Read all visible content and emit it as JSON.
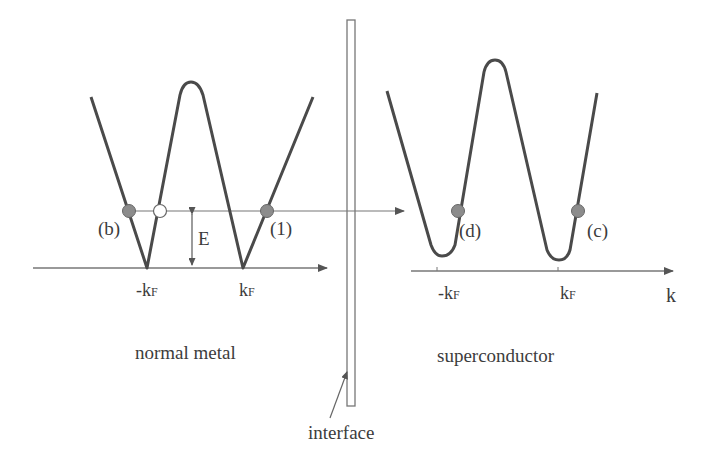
{
  "diagram": {
    "title": "",
    "regions": {
      "left": "normal metal",
      "right": "superconductor",
      "interface": "interface"
    },
    "energy_label": "E",
    "axis_label_k": "k",
    "left_ticks": {
      "neg": "-k",
      "pos": "k",
      "sub": "F"
    },
    "right_ticks": {
      "neg": "-k",
      "pos": "k",
      "sub": "F"
    },
    "points": {
      "b": "(b)",
      "one": "(1)",
      "d": "(d)",
      "c": "(c)"
    },
    "colors": {
      "line": "#4a4a4a",
      "filled_dot": "#8c8c8c",
      "open_dot": "#ffffff",
      "text": "#3c3c3c"
    }
  }
}
